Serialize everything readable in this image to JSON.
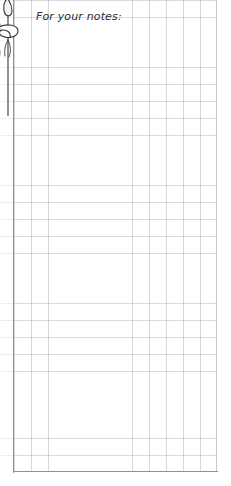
{
  "page": {
    "title": "For your notes",
    "width": 231,
    "height": 486,
    "background_color": "#ffffff"
  },
  "heading": {
    "text": "For your notes:",
    "color": "#2e2e30",
    "style": "italic"
  },
  "grid": {
    "label": "graph-paper-grid",
    "cell_size_px": 17,
    "columns": 12,
    "rows": 28,
    "line_color": "#969ba5",
    "border_color": "#8d9097",
    "left_edge_px": 14,
    "right_edge_px": 217,
    "bottom_edge_px": 472
  },
  "decoration": {
    "name": "hanging-plant-illustration",
    "description": "grayscale line drawing of a hanging vine with oval leaves, cropped by the left page edge",
    "line_color": "#3a3a3c",
    "leaf_fill_color": "#b9b9bb",
    "leaf_fill_color_dark": "#9d9da0"
  }
}
